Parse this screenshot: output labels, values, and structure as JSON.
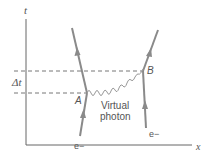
{
  "diagram": {
    "axes": {
      "vertical_label": "t",
      "horizontal_label": "x"
    },
    "interval_label": "Δt",
    "vertices": [
      {
        "id": "A",
        "label": "A"
      },
      {
        "id": "B",
        "label": "B"
      }
    ],
    "particles": [
      {
        "id": "left_electron",
        "label": "e−"
      },
      {
        "id": "right_electron",
        "label": "e−"
      }
    ],
    "exchange": {
      "line1": "Virtual",
      "line2": "photon"
    },
    "colors": {
      "lines": "#8a8a8a",
      "text": "#555555",
      "axes": "#666666"
    }
  }
}
